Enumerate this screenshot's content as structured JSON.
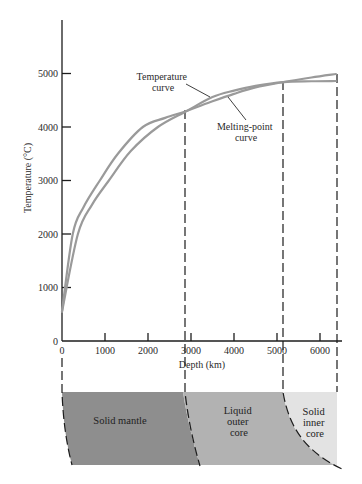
{
  "chart_data": {
    "type": "line",
    "title": "",
    "xlabel": "Depth (km)",
    "ylabel": "Temperature (°C)",
    "xlim": [
      0,
      6370
    ],
    "ylim": [
      0,
      5800
    ],
    "grid": false,
    "legend": "none (inline annotations with pointer lines)",
    "x_ticks": [
      0,
      1000,
      2000,
      3000,
      4000,
      5000,
      6000
    ],
    "y_ticks": [
      0,
      1000,
      2000,
      3000,
      4000,
      5000
    ],
    "series": [
      {
        "name": "Temperature curve",
        "color": "#9a9a9a",
        "points": [
          [
            0,
            550
          ],
          [
            370,
            2000
          ],
          [
            700,
            2550
          ],
          [
            1090,
            3000
          ],
          [
            1600,
            3550
          ],
          [
            2230,
            4000
          ],
          [
            2900,
            4300
          ],
          [
            3500,
            4560
          ],
          [
            4000,
            4680
          ],
          [
            4500,
            4770
          ],
          [
            5150,
            4840
          ],
          [
            5800,
            4855
          ],
          [
            6370,
            4860
          ]
        ]
      },
      {
        "name": "Melting-point curve",
        "color": "#9a9a9a",
        "points": [
          [
            0,
            550
          ],
          [
            250,
            2000
          ],
          [
            500,
            2500
          ],
          [
            880,
            3000
          ],
          [
            1300,
            3500
          ],
          [
            1880,
            4000
          ],
          [
            2400,
            4170
          ],
          [
            2900,
            4300
          ],
          [
            3500,
            4480
          ],
          [
            4000,
            4620
          ],
          [
            4500,
            4740
          ],
          [
            5150,
            4840
          ],
          [
            5800,
            4925
          ],
          [
            6370,
            4990
          ]
        ]
      }
    ],
    "annotations": [
      {
        "lines": [
          "Temperature",
          "curve"
        ],
        "target": "Temperature curve"
      },
      {
        "lines": [
          "Melting-point",
          "curve"
        ],
        "target": "Melting-point curve"
      }
    ],
    "boundaries_km": [
      0,
      2900,
      5150,
      6370
    ],
    "layers": [
      {
        "lines": [
          "Solid mantle"
        ],
        "from_km": 0,
        "to_km": 2900,
        "color": "#8e8e8e"
      },
      {
        "lines": [
          "Liquid",
          "outer",
          "core"
        ],
        "from_km": 2900,
        "to_km": 5150,
        "color": "#b2b2b2"
      },
      {
        "lines": [
          "Solid",
          "inner",
          "core"
        ],
        "from_km": 5150,
        "to_km": 6370,
        "color": "#e3e3e3"
      }
    ]
  }
}
